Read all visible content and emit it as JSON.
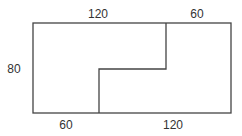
{
  "diagram": {
    "type": "dimensioned-rectangle-with-step-cut",
    "outer_rect": {
      "x": 33,
      "y": 23,
      "w": 198,
      "h": 90
    },
    "cut_path": [
      [
        166,
        23
      ],
      [
        166,
        69
      ],
      [
        99,
        69
      ],
      [
        99,
        113
      ]
    ],
    "labels": {
      "top_left": {
        "text": "120",
        "x": 98,
        "y": 18
      },
      "top_right": {
        "text": "60",
        "x": 197,
        "y": 18
      },
      "left": {
        "text": "80",
        "x": 14,
        "y": 73
      },
      "bottom_left": {
        "text": "60",
        "x": 66,
        "y": 129
      },
      "bottom_right": {
        "text": "120",
        "x": 173,
        "y": 129
      }
    },
    "colors": {
      "line": "#444444",
      "text": "#333333",
      "background": "#ffffff"
    }
  }
}
